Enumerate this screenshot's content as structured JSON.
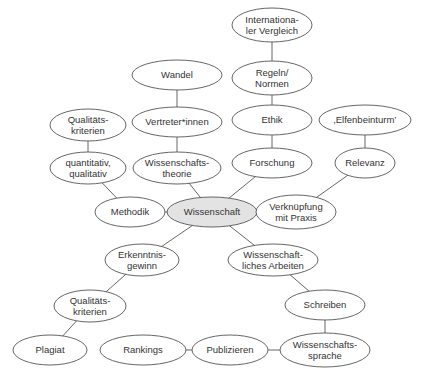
{
  "diagram": {
    "type": "mind-map",
    "colors": {
      "stroke": "#555555",
      "fill": "#ffffff",
      "center_fill": "#e3e3e3",
      "text": "#333333"
    },
    "center_node": "wissenschaft",
    "nodes": [
      {
        "id": "international",
        "lines": [
          "Internationa-",
          "ler Vergleich"
        ],
        "cx": 272,
        "cy": 25,
        "rx": 40,
        "ry": 17
      },
      {
        "id": "regeln",
        "lines": [
          "Regeln/",
          "Normen"
        ],
        "cx": 272,
        "cy": 78,
        "rx": 40,
        "ry": 17
      },
      {
        "id": "wandel",
        "lines": [
          "Wandel"
        ],
        "cx": 177,
        "cy": 75,
        "rx": 45,
        "ry": 15
      },
      {
        "id": "ethik",
        "lines": [
          "Ethik"
        ],
        "cx": 272,
        "cy": 120,
        "rx": 40,
        "ry": 15
      },
      {
        "id": "elfenbeinturm",
        "lines": [
          "‚Elfenbeinturm’"
        ],
        "cx": 365,
        "cy": 120,
        "rx": 46,
        "ry": 15
      },
      {
        "id": "vertreter",
        "lines": [
          "Vertreter*innen"
        ],
        "cx": 177,
        "cy": 122,
        "rx": 45,
        "ry": 15
      },
      {
        "id": "qualitaet_top",
        "lines": [
          "Qualitäts-",
          "kriterien"
        ],
        "cx": 88,
        "cy": 125,
        "rx": 38,
        "ry": 16
      },
      {
        "id": "quantitativ",
        "lines": [
          "quantitativ,",
          "qualitativ"
        ],
        "cx": 88,
        "cy": 168,
        "rx": 38,
        "ry": 16
      },
      {
        "id": "wisstheorie",
        "lines": [
          "Wissenschafts-",
          "theorie"
        ],
        "cx": 177,
        "cy": 168,
        "rx": 44,
        "ry": 16
      },
      {
        "id": "forschung",
        "lines": [
          "Forschung"
        ],
        "cx": 272,
        "cy": 163,
        "rx": 40,
        "ry": 15
      },
      {
        "id": "relevanz",
        "lines": [
          "Relevanz"
        ],
        "cx": 365,
        "cy": 163,
        "rx": 30,
        "ry": 15
      },
      {
        "id": "methodik",
        "lines": [
          "Methodik"
        ],
        "cx": 130,
        "cy": 212,
        "rx": 35,
        "ry": 15
      },
      {
        "id": "wissenschaft",
        "lines": [
          "Wissenschaft"
        ],
        "cx": 212,
        "cy": 212,
        "rx": 45,
        "ry": 15,
        "highlight": true
      },
      {
        "id": "verknuepfung",
        "lines": [
          "Verknüpfung",
          "mit Praxis"
        ],
        "cx": 296,
        "cy": 212,
        "rx": 40,
        "ry": 17
      },
      {
        "id": "erkenntnis",
        "lines": [
          "Erkenntnis-",
          "gewinn"
        ],
        "cx": 142,
        "cy": 260,
        "rx": 37,
        "ry": 16
      },
      {
        "id": "wissarbeiten",
        "lines": [
          "Wissenschaft-",
          "liches Arbeiten"
        ],
        "cx": 273,
        "cy": 260,
        "rx": 45,
        "ry": 16
      },
      {
        "id": "qualitaet_bottom",
        "lines": [
          "Qualitäts-",
          "kriterien"
        ],
        "cx": 90,
        "cy": 306,
        "rx": 36,
        "ry": 16
      },
      {
        "id": "schreiben",
        "lines": [
          "Schreiben"
        ],
        "cx": 325,
        "cy": 305,
        "rx": 40,
        "ry": 15
      },
      {
        "id": "plagiat",
        "lines": [
          "Plagiat"
        ],
        "cx": 50,
        "cy": 350,
        "rx": 37,
        "ry": 15
      },
      {
        "id": "rankings",
        "lines": [
          "Rankings"
        ],
        "cx": 143,
        "cy": 350,
        "rx": 43,
        "ry": 15
      },
      {
        "id": "publizieren",
        "lines": [
          "Publizieren"
        ],
        "cx": 230,
        "cy": 350,
        "rx": 38,
        "ry": 15
      },
      {
        "id": "wisssprache",
        "lines": [
          "Wissenschafts-",
          "sprache"
        ],
        "cx": 325,
        "cy": 350,
        "rx": 45,
        "ry": 17
      }
    ],
    "edges": [
      [
        "international",
        "regeln"
      ],
      [
        "regeln",
        "ethik"
      ],
      [
        "ethik",
        "forschung"
      ],
      [
        "forschung",
        "wissenschaft"
      ],
      [
        "wandel",
        "vertreter"
      ],
      [
        "vertreter",
        "wisstheorie"
      ],
      [
        "wisstheorie",
        "wissenschaft"
      ],
      [
        "qualitaet_top",
        "quantitativ"
      ],
      [
        "quantitativ",
        "methodik"
      ],
      [
        "methodik",
        "wissenschaft"
      ],
      [
        "elfenbeinturm",
        "relevanz"
      ],
      [
        "relevanz",
        "verknuepfung"
      ],
      [
        "wissenschaft",
        "verknuepfung"
      ],
      [
        "wissenschaft",
        "erkenntnis"
      ],
      [
        "wissenschaft",
        "wissarbeiten"
      ],
      [
        "erkenntnis",
        "qualitaet_bottom"
      ],
      [
        "qualitaet_bottom",
        "plagiat"
      ],
      [
        "wissarbeiten",
        "schreiben"
      ],
      [
        "schreiben",
        "wisssprache"
      ],
      [
        "rankings",
        "publizieren"
      ],
      [
        "publizieren",
        "wisssprache"
      ]
    ]
  }
}
